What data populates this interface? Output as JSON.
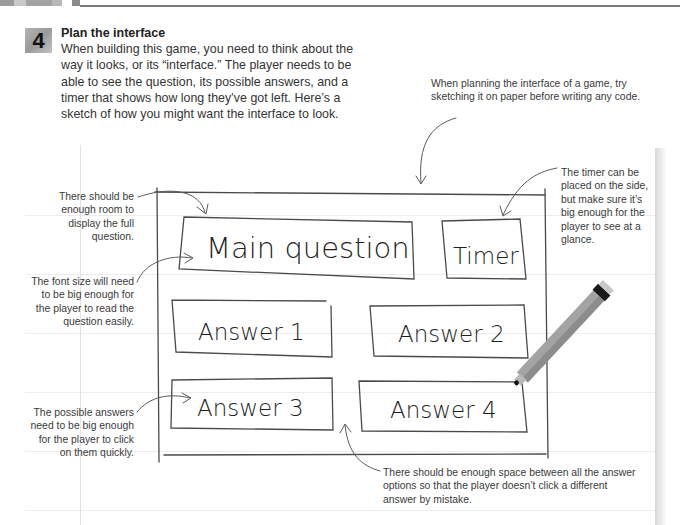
{
  "header": {
    "strip_colors": [
      "#9b9b9b",
      "#c9c9c9",
      "#8d8d8d",
      "#d3d3d3",
      "#a8a8a8",
      "#ffffff",
      "#8a8a8a"
    ],
    "rule_color": "#7a7a7a"
  },
  "step": {
    "number": "4",
    "title": "Plan the interface",
    "body": "When building this game, you need to think about the way it looks, or its “interface.” The player needs to be able to see the question, its possible answers, and a timer that shows how long they’ve got left. Here’s a sketch of how you might want the interface to look."
  },
  "annotations": {
    "planning_tip": "When planning the interface of a game, try sketching it on paper before writing any code.",
    "room_for_question": "There should be enough room to display the full question.",
    "font_size": "The font size will need to be big enough for the player to read the question easily.",
    "answer_size": "The possible answers need to be big enough for the player to click on them quickly.",
    "timer_placement": "The timer can be placed on the side, but make sure it’s big enough for the player to see at a glance.",
    "answer_spacing": "There should be enough space between all the answer options so that the player doesn’t click a different answer by mistake."
  },
  "sketch": {
    "main_question": "Main question",
    "timer": "Timer",
    "answers": [
      "Answer 1",
      "Answer 2",
      "Answer 3",
      "Answer 4"
    ]
  },
  "illustration": {
    "marker_color": "#9e9e9e",
    "marker_cap_color": "#1a1a1a"
  }
}
